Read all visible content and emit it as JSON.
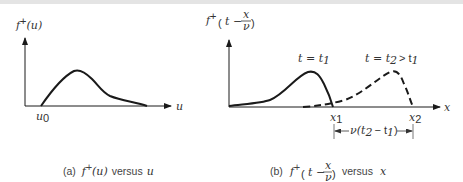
{
  "panels": [
    {
      "id": "a",
      "y_label_func": "f",
      "y_label_sup": "+",
      "y_label_arg": "(u)",
      "x_axis_label": "u",
      "x_tick_label": "u",
      "x_tick_sub": "0",
      "caption_prefix": "(a)",
      "caption_func": "f",
      "caption_sup": "+",
      "caption_arg": "(u)",
      "caption_versus": "versus",
      "caption_var": "u"
    },
    {
      "id": "b",
      "y_label_func": "f",
      "y_label_sup": "+",
      "y_label_t": "t −",
      "y_label_num": "x",
      "y_label_den": "ν",
      "x_axis_label": "x",
      "curve1_label": "t = t",
      "curve1_sub": "1",
      "curve2_label_a": "t = t",
      "curve2_sub_a": "2",
      "curve2_label_b": "> t",
      "curve2_sub_b": "1",
      "tick1_label": "x",
      "tick1_sub": "1",
      "tick2_label": "x",
      "tick2_sub": "2",
      "dimension_label_a": "ν(t",
      "dimension_sub_a": "2",
      "dimension_label_b": "− t",
      "dimension_sub_b": "1",
      "dimension_label_c": ")",
      "caption_prefix": "(b)",
      "caption_func": "f",
      "caption_sup": "+",
      "caption_t": "t −",
      "caption_num": "x",
      "caption_den": "ν",
      "caption_versus": "versus",
      "caption_var": "x"
    }
  ],
  "colors": {
    "ink": "#1a1a1a",
    "text": "#333333",
    "topbar": "#e4e4e4"
  }
}
